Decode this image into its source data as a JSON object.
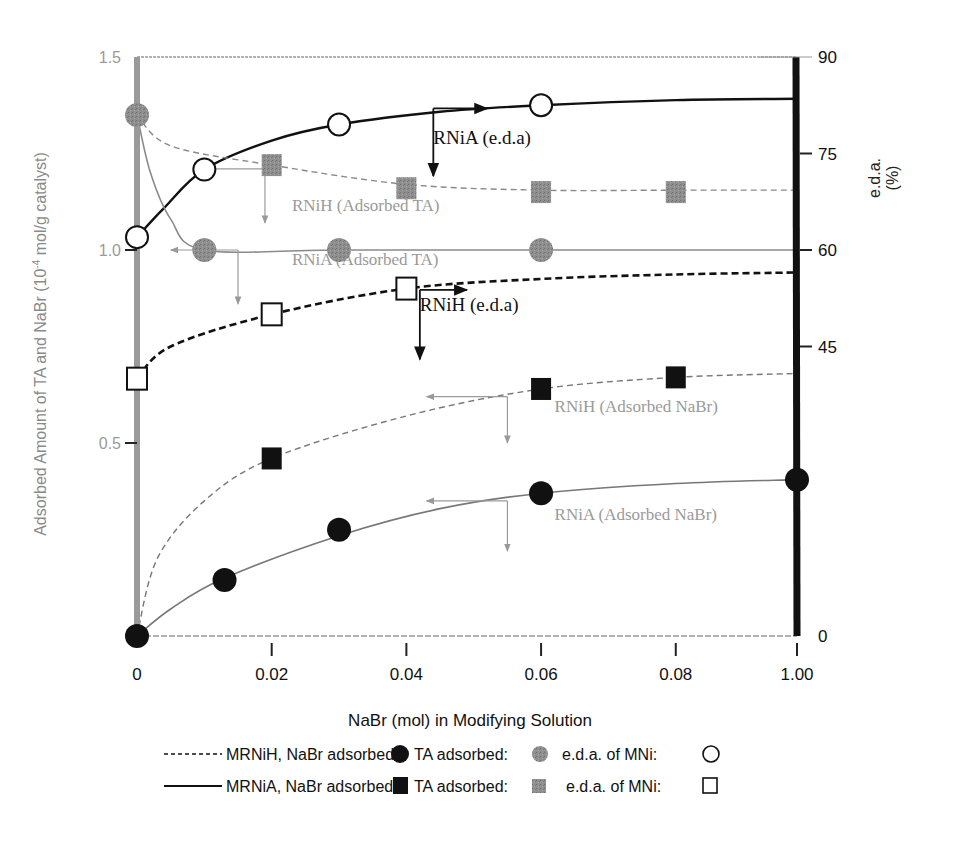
{
  "chart_data": {
    "type": "line",
    "title": "",
    "xlabel": "NaBr (mol) in Modifying Solution",
    "ylabel_left": "Adsorbed Amount of TA and NaBr (10^-4 mol/g catalyst)",
    "ylabel_left_parts": {
      "before": "Adsorbed Amount of TA and NaBr (10",
      "sup": "-4",
      "after": " mol/g catalyst)"
    },
    "ylabel_right_line1": "e.d.a.",
    "ylabel_right_line2": "(%)",
    "x_ticks": [
      {
        "label": "0",
        "pos": 0
      },
      {
        "label": "0.02",
        "pos": 0.02
      },
      {
        "label": "0.04",
        "pos": 0.04
      },
      {
        "label": "0.06",
        "pos": 0.06
      },
      {
        "label": "0.08",
        "pos": 0.08
      },
      {
        "label": "1.00",
        "pos": 0.098
      }
    ],
    "x_axis_note": "x axis is broken: last tick labelled 1.00 plotted at position ~0.098",
    "y_left_ticks": [
      {
        "label": "0.5",
        "value": 0.5
      },
      {
        "label": "1.0",
        "value": 1.0
      },
      {
        "label": "1.5",
        "value": 1.5
      }
    ],
    "y_right_ticks": [
      {
        "label": "0",
        "value": 0
      },
      {
        "label": "45",
        "value": 45
      },
      {
        "label": "60",
        "value": 60
      },
      {
        "label": "75",
        "value": 75
      },
      {
        "label": "90",
        "value": 90
      }
    ],
    "ylim_left": [
      0,
      1.5
    ],
    "ylim_right": [
      0,
      90
    ],
    "grid": false,
    "legend_position": "bottom",
    "series": [
      {
        "name": "MRNiA e.d.a. (RNiA e.d.a)",
        "axis": "right",
        "marker": "open-circle",
        "line": "solid-thick",
        "color": "#111111",
        "x": [
          0,
          0.01,
          0.03,
          0.06
        ],
        "values": [
          62,
          72.5,
          79.5,
          82.5
        ],
        "curve": [
          [
            0,
            62
          ],
          [
            0.004,
            66.5
          ],
          [
            0.01,
            72.5
          ],
          [
            0.02,
            77
          ],
          [
            0.03,
            79.5
          ],
          [
            0.045,
            81.5
          ],
          [
            0.06,
            82.5
          ],
          [
            0.08,
            83.3
          ],
          [
            0.098,
            83.5
          ]
        ]
      },
      {
        "name": "MRNiH e.d.a. (RNiH e.d.a)",
        "axis": "right",
        "marker": "open-square",
        "line": "dashed-thick",
        "color": "#111111",
        "x": [
          0,
          0.02,
          0.04
        ],
        "values": [
          40,
          50,
          54
        ],
        "curve": [
          [
            0,
            40
          ],
          [
            0.005,
            45
          ],
          [
            0.02,
            50
          ],
          [
            0.04,
            54
          ],
          [
            0.06,
            55.5
          ],
          [
            0.08,
            56.2
          ],
          [
            0.098,
            56.5
          ]
        ]
      },
      {
        "name": "RNiH (Adsorbed TA)",
        "axis": "left",
        "marker": "gray-square",
        "line": "dashed-thin",
        "color": "#8a8a8a",
        "x": [
          0.02,
          0.04,
          0.06,
          0.08
        ],
        "values": [
          1.22,
          1.16,
          1.15,
          1.15
        ],
        "curve": [
          [
            0,
            1.35
          ],
          [
            0.005,
            1.27
          ],
          [
            0.02,
            1.22
          ],
          [
            0.04,
            1.17
          ],
          [
            0.06,
            1.155
          ],
          [
            0.08,
            1.155
          ],
          [
            0.098,
            1.155
          ]
        ]
      },
      {
        "name": "RNiA (Adsorbed TA)",
        "axis": "left",
        "marker": "gray-circle",
        "line": "solid-thin",
        "color": "#8a8a8a",
        "x": [
          0,
          0.01,
          0.03,
          0.06
        ],
        "values": [
          1.35,
          1.0,
          1.0,
          1.0
        ],
        "curve": [
          [
            0,
            1.35
          ],
          [
            0.002,
            1.2
          ],
          [
            0.005,
            1.08
          ],
          [
            0.01,
            1.0
          ],
          [
            0.03,
            1.0
          ],
          [
            0.06,
            1.0
          ],
          [
            0.098,
            1.0
          ]
        ]
      },
      {
        "name": "RNiH (Adsorbed NaBr)",
        "axis": "left",
        "marker": "black-square",
        "line": "dashed-thin",
        "color": "#777777",
        "x": [
          0.02,
          0.06,
          0.08
        ],
        "values": [
          0.46,
          0.64,
          0.67
        ],
        "curve": [
          [
            0,
            0
          ],
          [
            0.003,
            0.2
          ],
          [
            0.01,
            0.35
          ],
          [
            0.02,
            0.46
          ],
          [
            0.04,
            0.57
          ],
          [
            0.06,
            0.64
          ],
          [
            0.08,
            0.67
          ],
          [
            0.098,
            0.68
          ]
        ]
      },
      {
        "name": "RNiA (Adsorbed NaBr)",
        "axis": "left",
        "marker": "black-circle",
        "line": "solid-thin",
        "color": "#777777",
        "x": [
          0,
          0.013,
          0.03,
          0.06,
          0.098
        ],
        "values": [
          0,
          0.145,
          0.275,
          0.37,
          0.405
        ],
        "curve": [
          [
            0,
            0
          ],
          [
            0.005,
            0.07
          ],
          [
            0.013,
            0.15
          ],
          [
            0.03,
            0.26
          ],
          [
            0.045,
            0.33
          ],
          [
            0.06,
            0.37
          ],
          [
            0.08,
            0.395
          ],
          [
            0.098,
            0.405
          ]
        ]
      }
    ],
    "annotations": [
      {
        "text": "RNiA (e.d.a)",
        "color": "#111111",
        "x": 0.044,
        "yr": 76.5,
        "arrow_from": [
          0.044,
          82
        ],
        "arrow_right_to": [
          0.052,
          82
        ],
        "arrow_down_to": [
          0.044,
          71.5
        ]
      },
      {
        "text": "RNiH (e.d.a)",
        "color": "#111111",
        "x": 0.042,
        "yr": 50.5,
        "arrow_from": [
          0.042,
          53.8
        ],
        "arrow_right_to": [
          0.049,
          53.8
        ],
        "arrow_down_to": [
          0.042,
          43
        ]
      },
      {
        "text": "RNiH (Adsorbed TA)",
        "color": "#9a9a9a",
        "x": 0.023,
        "yl": 1.1,
        "arrow_from": [
          0.019,
          1.21
        ],
        "arrow_left_to": [
          0.009,
          1.21
        ],
        "arrow_down_to": [
          0.019,
          1.07
        ]
      },
      {
        "text": "RNiA (Adsorbed TA)",
        "color": "#9a9a9a",
        "x": 0.023,
        "yl": 0.96,
        "arrow_from": [
          0.015,
          1.0
        ],
        "arrow_left_to": [
          0.005,
          1.0
        ],
        "arrow_down_to": [
          0.015,
          0.86
        ]
      },
      {
        "text": "RNiH (Adsorbed NaBr)",
        "color": "#9a9a9a",
        "x": 0.062,
        "yl": 0.58,
        "arrow_from": [
          0.055,
          0.62
        ],
        "arrow_left_to": [
          0.043,
          0.62
        ],
        "arrow_down_to": [
          0.055,
          0.5
        ]
      },
      {
        "text": "RNiA (Adsorbed NaBr)",
        "color": "#9a9a9a",
        "x": 0.062,
        "yl": 0.3,
        "arrow_from": [
          0.055,
          0.35
        ],
        "arrow_left_to": [
          0.043,
          0.35
        ],
        "arrow_down_to": [
          0.055,
          0.22
        ]
      }
    ]
  },
  "legend": {
    "rows": [
      {
        "line_style": "dashed",
        "label": "MRNiH, NaBr adsorbed:",
        "nabr_marker": "black-circle",
        "ta_label": "TA adsorbed:",
        "ta_marker": "gray-circle",
        "eda_label": "e.d.a. of MNi:",
        "eda_marker": "open-circle"
      },
      {
        "line_style": "solid",
        "label": "MRNiA, NaBr adsorbed:",
        "nabr_marker": "black-square",
        "ta_label": "TA adsorbed:",
        "ta_marker": "gray-square",
        "eda_label": "e.d.a. of MNi:",
        "eda_marker": "open-square"
      }
    ]
  },
  "colors": {
    "left_axis": "#9a9a9a",
    "right_axis": "#111111",
    "gray_marker": "#8f8f8f",
    "black": "#111111",
    "gray_text": "#8a8a8a"
  }
}
